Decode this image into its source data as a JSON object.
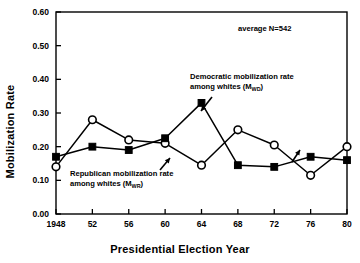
{
  "chart_data": {
    "type": "line",
    "title": "",
    "xlabel": "Presidential Election Year",
    "ylabel": "Mobilization Rate",
    "x": [
      1948,
      1952,
      1956,
      1960,
      1964,
      1968,
      1972,
      1976,
      1980
    ],
    "categories": [
      "1948",
      "52",
      "56",
      "60",
      "64",
      "68",
      "72",
      "76",
      "80"
    ],
    "xtick_labels": [
      "1948",
      "52",
      "56",
      "60",
      "64",
      "68",
      "72",
      "76",
      "80"
    ],
    "ytick_labels": [
      "0.00",
      "0.10",
      "0.20",
      "0.30",
      "0.40",
      "0.50",
      "0.60"
    ],
    "ytick_values": [
      0.0,
      0.1,
      0.2,
      0.3,
      0.4,
      0.5,
      0.6
    ],
    "ylim": [
      0.0,
      0.6
    ],
    "xlim": [
      1948,
      1980
    ],
    "grid": false,
    "legend_position": "inline-annotations",
    "series": [
      {
        "name": "Democratic mobilization rate among whites (MWD)",
        "marker": "filled-square",
        "values": [
          0.17,
          0.2,
          0.19,
          0.225,
          0.33,
          0.145,
          0.14,
          0.17,
          0.16
        ]
      },
      {
        "name": "Republican mobilization rate among whites (MWR)",
        "marker": "open-circle",
        "values": [
          0.14,
          0.28,
          0.22,
          0.21,
          0.145,
          0.25,
          0.205,
          0.115,
          0.2
        ]
      }
    ],
    "annotations": [
      {
        "name": "average-n",
        "text": "average N=542",
        "x_px": 238,
        "y_px": 31
      },
      {
        "name": "democratic-series-label",
        "line1": "Democratic mobilization rate",
        "line2_pre": "among whites (M",
        "line2_sub": "WD",
        "line2_post": ")",
        "x_px": 190,
        "y_px": 79
      },
      {
        "name": "republican-series-label",
        "line1": "Republican mobilization rate",
        "line2_pre": "among whites (M",
        "line2_sub": "WR",
        "line2_post": ")",
        "x_px": 70,
        "y_px": 176
      }
    ],
    "colors": {
      "axis": "#000000",
      "series_democratic": "#000000",
      "series_republican": "#000000",
      "background": "#ffffff"
    }
  }
}
